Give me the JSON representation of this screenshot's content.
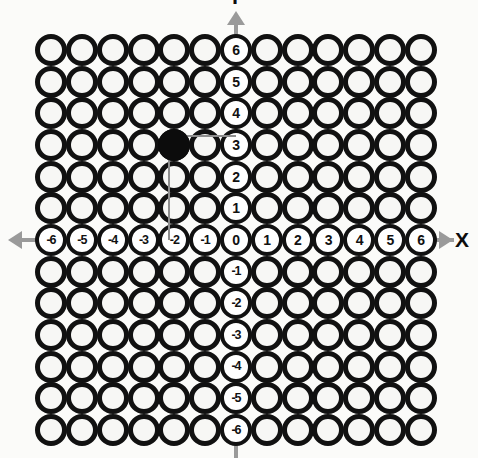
{
  "figure": {
    "type": "coordinate-grid",
    "background_color": "#fbfbf9",
    "circle_color": "#111111",
    "point_color": "#0c0c0c",
    "axis_color": "#9a9a9a",
    "guide_color": "#8e8e8e"
  },
  "grid": {
    "columns": 13,
    "rows": 13,
    "x_min": -6,
    "x_max": 6,
    "y_min": -6,
    "y_max": 6,
    "origin_px": {
      "x": 236,
      "y": 240
    },
    "spacing_px": {
      "x": 30.83,
      "y": 31.67
    },
    "circle_diameter_px": 32
  },
  "axes": {
    "x": {
      "name": "X",
      "tick_labels": [
        "-6",
        "-5",
        "-4",
        "-3",
        "-2",
        "-1",
        "0",
        "1",
        "2",
        "3",
        "4",
        "5",
        "6"
      ],
      "left_arrow": "arrow-left",
      "right_arrow": "arrow-right"
    },
    "y": {
      "name": "Y",
      "name_visible": false,
      "tick_labels_above_origin": [
        "6",
        "5",
        "4",
        "3",
        "2",
        "1"
      ],
      "tick_labels_below_origin": [
        "-1",
        "-2",
        "-3",
        "-4",
        "-5",
        "-6"
      ],
      "up_arrow": "arrow-up"
    },
    "origin_label": "0"
  },
  "chart_data": {
    "type": "scatter",
    "title": "",
    "xlabel": "X",
    "ylabel": "Y",
    "xlim": [
      -6,
      6
    ],
    "ylim": [
      -6,
      6
    ],
    "xticks": [
      -6,
      -5,
      -4,
      -3,
      -2,
      -1,
      0,
      1,
      2,
      3,
      4,
      5,
      6
    ],
    "yticks": [
      -6,
      -5,
      -4,
      -3,
      -2,
      -1,
      0,
      1,
      2,
      3,
      4,
      5,
      6
    ],
    "grid": true,
    "legend": "none",
    "points": [
      {
        "label": "plotted-point",
        "x": -2,
        "y": 3,
        "filled": true
      }
    ],
    "annotations": [
      {
        "kind": "guide-line",
        "from": [
          -2,
          3
        ],
        "to": [
          0,
          3
        ],
        "orientation": "horizontal"
      },
      {
        "kind": "guide-line",
        "from": [
          -2,
          3
        ],
        "to": [
          -2,
          0
        ],
        "orientation": "vertical"
      }
    ]
  }
}
